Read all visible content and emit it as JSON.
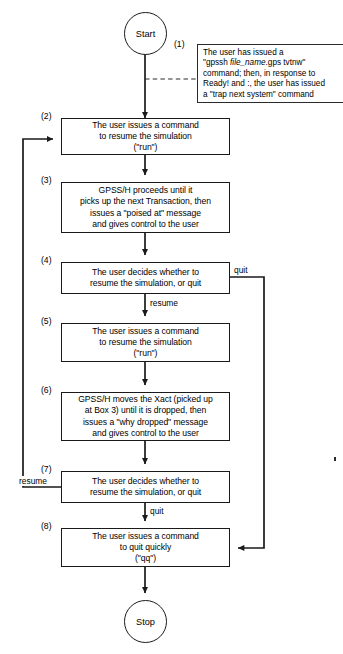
{
  "figure": {
    "start_label": "Start",
    "stop_label": "Stop"
  },
  "note": {
    "number": "(1)",
    "line1": "The user has issued a",
    "line2_pre": "\"gpssh ",
    "line2_em": "file_name",
    "line2_post": ".gps tvtnw\"",
    "line3": "command; then, in response to",
    "line4": "Ready! and :, the user has issued",
    "line5": "a \"trap next system\" command",
    "full_text": "The user has issued a \"gpssh file_name.gps tvtnw\" command; then, in response to Ready! and :, the user has issued a \"trap next system\" command"
  },
  "steps": [
    {
      "number": "(2)",
      "text": "The user issues a command\nto resume the simulation\n(\"run\")"
    },
    {
      "number": "(3)",
      "text": "GPSS/H proceeds until it\npicks up the next Transaction, then\nissues a \"poised at\" message\nand gives control to the user"
    },
    {
      "number": "(4)",
      "text": "The user decides whether to\nresume the simulation, or quit"
    },
    {
      "number": "(5)",
      "text": "The user issues a command\nto resume the simulation\n(\"run\")"
    },
    {
      "number": "(6)",
      "text": "GPSS/H moves the Xact (picked up\nat Box 3) until it is dropped, then\nissues a \"why dropped\" message\nand gives control to the user"
    },
    {
      "number": "(7)",
      "text": "The user decides whether to\nresume the simulation, or quit"
    },
    {
      "number": "(8)",
      "text": "The user issues a command\nto quit quickly\n(\"qq\")"
    }
  ],
  "edge_labels": {
    "quit_from_4": "quit",
    "resume_from_4": "resume",
    "resume_from_7": "resume",
    "quit_from_7": "quit"
  },
  "colors": {
    "line": "#1a1a1a",
    "text": "#000000",
    "background": "#ffffff"
  }
}
